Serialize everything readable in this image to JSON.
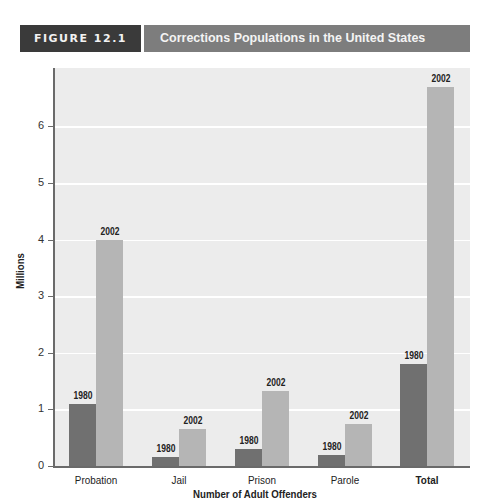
{
  "header": {
    "figure_label": "FIGURE 12.1",
    "title": "Corrections Populations in the United States"
  },
  "axes": {
    "ylabel": "Millions",
    "xlabel": "Number of Adult Offenders",
    "yticks": [
      "0",
      "1",
      "2",
      "3",
      "4",
      "5",
      "6"
    ]
  },
  "categories": [
    "Probation",
    "Jail",
    "Prison",
    "Parole",
    "Total"
  ],
  "series_labels": [
    "1980",
    "2002"
  ],
  "colors": {
    "s1980": "#707070",
    "s2002": "#b5b5b5",
    "plot_bg": "#ececec",
    "header_dark": "#3a3a3a",
    "header_gray": "#7d7d7d"
  },
  "chart_data": {
    "type": "bar",
    "title": "Corrections Populations in the United States",
    "figure_label": "FIGURE 12.1",
    "xlabel": "Number of Adult Offenders",
    "ylabel": "Millions",
    "categories": [
      "Probation",
      "Jail",
      "Prison",
      "Parole",
      "Total"
    ],
    "series": [
      {
        "name": "1980",
        "values": [
          1.1,
          0.16,
          0.3,
          0.2,
          1.8
        ]
      },
      {
        "name": "2002",
        "values": [
          4.0,
          0.66,
          1.33,
          0.75,
          6.7
        ]
      }
    ],
    "ylim": [
      0,
      7
    ],
    "yticks": [
      0,
      1,
      2,
      3,
      4,
      5,
      6
    ],
    "grid": true,
    "legend": "data labels above each bar (1980 / 2002)"
  }
}
